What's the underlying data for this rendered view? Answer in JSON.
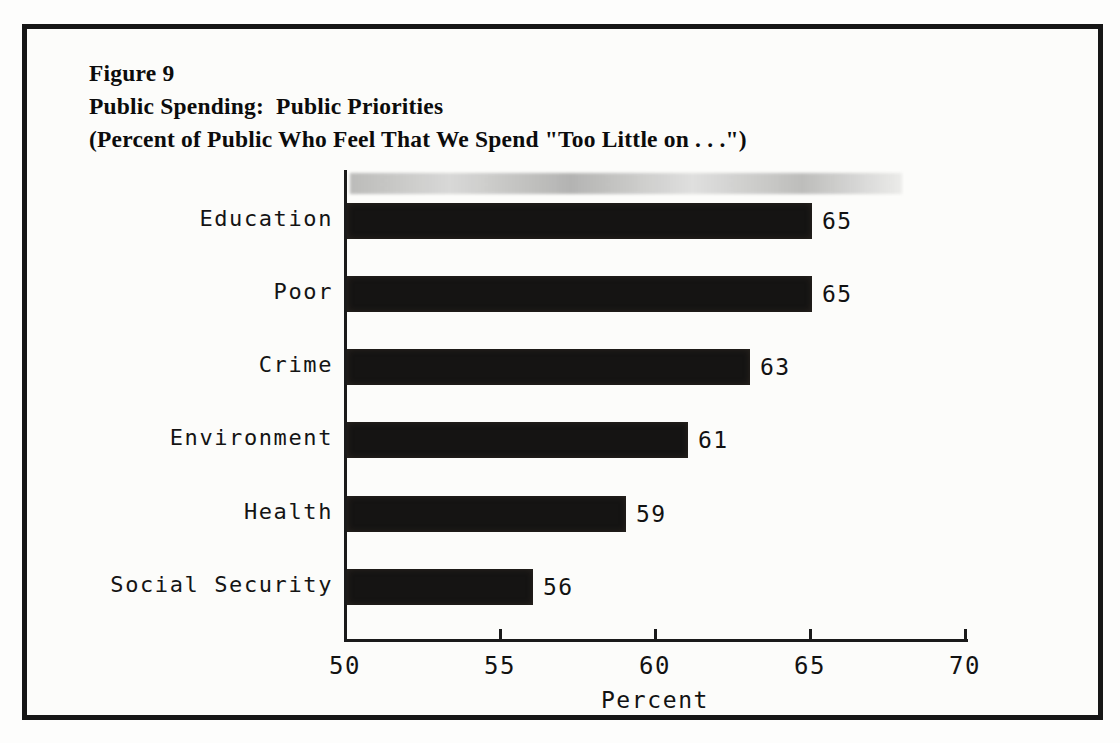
{
  "figure": {
    "label": "Figure 9",
    "title": "Public Spending:  Public Priorities",
    "subtitle": "(Percent of Public Who Feel That We Spend \"Too Little on . . .\")"
  },
  "chart_data": {
    "type": "bar",
    "orientation": "horizontal",
    "title": "Public Spending: Public Priorities",
    "subtitle": "Percent of Public Who Feel That We Spend \"Too Little on . . .\"",
    "categories": [
      "Education",
      "Poor",
      "Crime",
      "Environment",
      "Health",
      "Social Security"
    ],
    "values": [
      65,
      65,
      63,
      61,
      59,
      56
    ],
    "value_labels": [
      "65",
      "65",
      "63",
      "61",
      "59",
      "56"
    ],
    "xlabel": "Percent",
    "ylabel": "",
    "xlim": [
      50,
      70
    ],
    "xticks": [
      50,
      55,
      60,
      65,
      70
    ],
    "grid": false,
    "legend": false,
    "bar_color": "#151413",
    "background_color": "#fcfcfa"
  }
}
